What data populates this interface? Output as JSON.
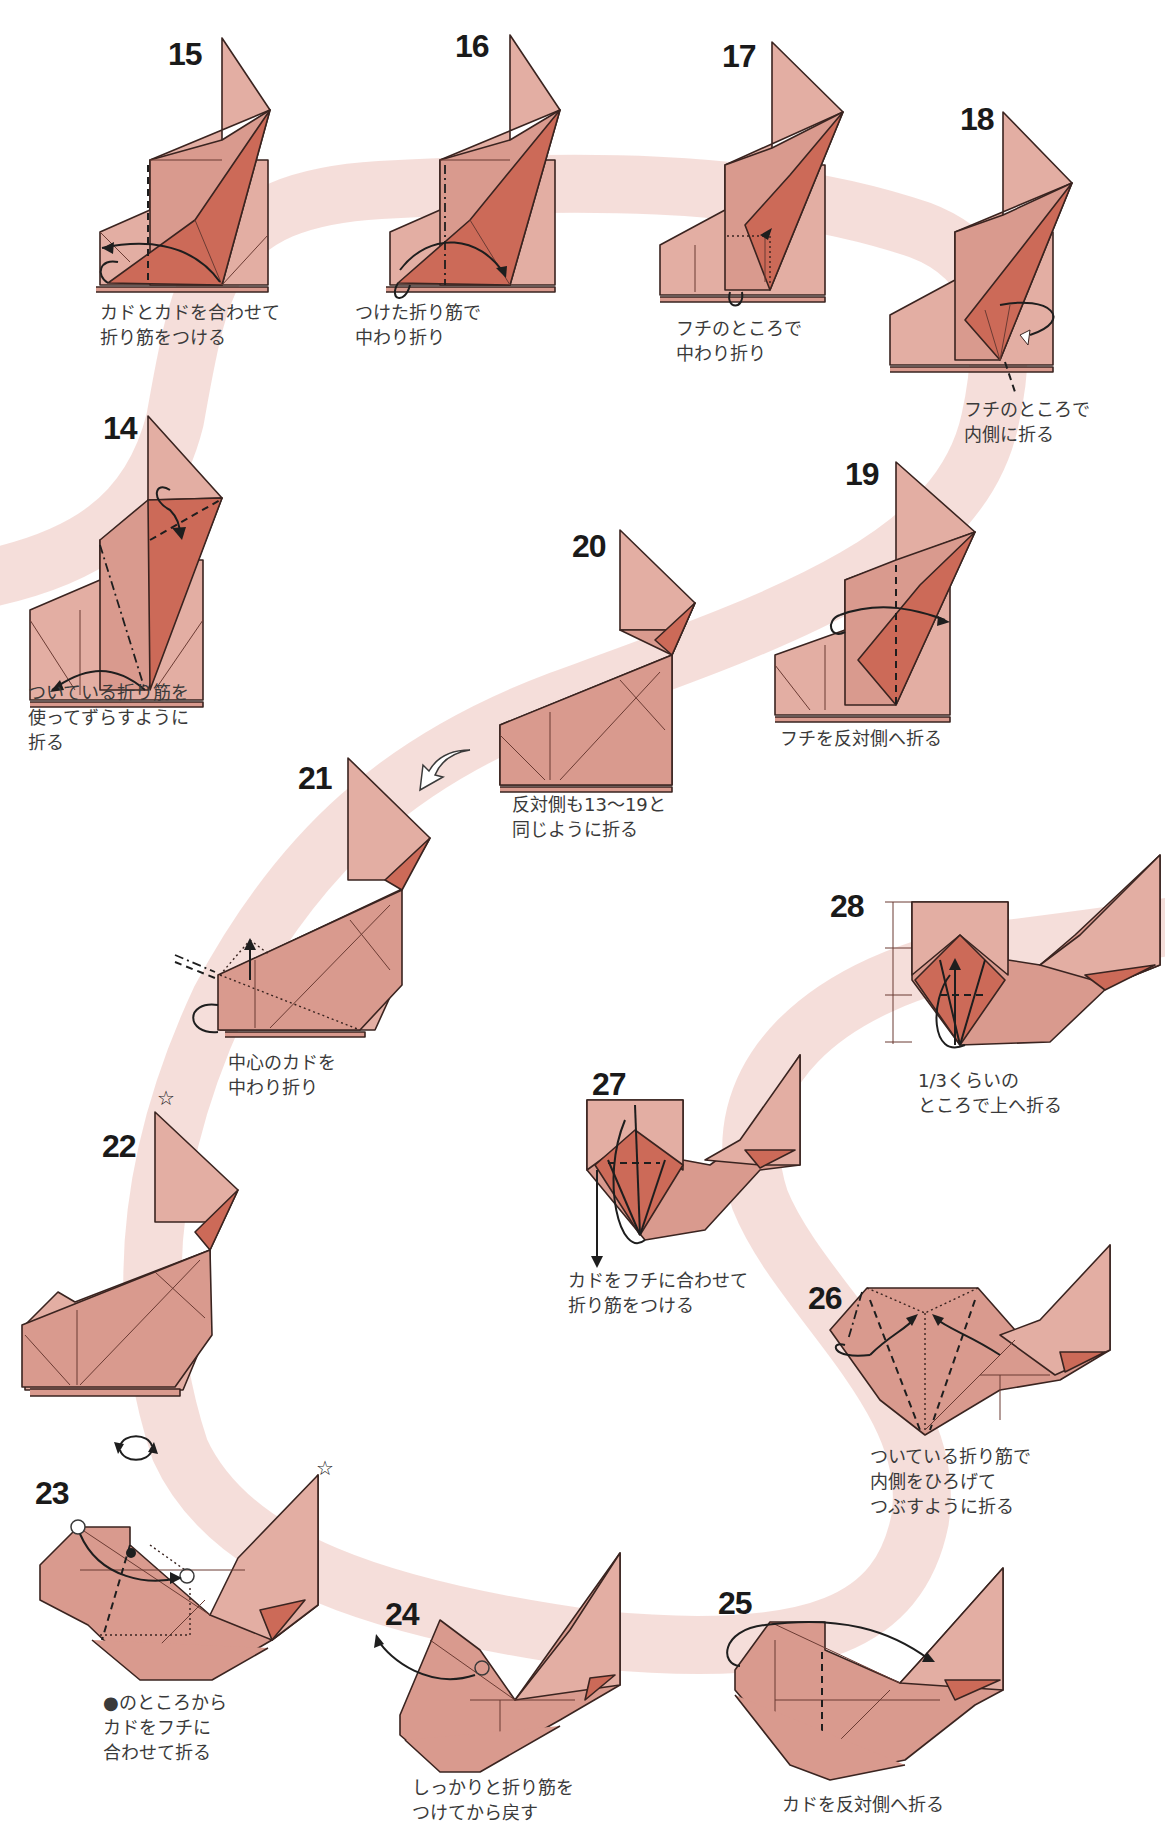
{
  "page": {
    "colors": {
      "paper": "#d99a8e",
      "paper_light": "#e3aea3",
      "paper_dark": "#cc6a58",
      "line": "#3a2420",
      "guide_band": "#f4dcd8",
      "number_text": "#1a1a1a",
      "caption_text": "#3a3a3a"
    }
  },
  "steps": [
    {
      "number": "14",
      "caption": "ついている折り筋を\n使ってずらすように\n折る"
    },
    {
      "number": "15",
      "caption": "カドとカドを合わせて\n折り筋をつける"
    },
    {
      "number": "16",
      "caption": "つけた折り筋で\n中わり折り"
    },
    {
      "number": "17",
      "caption": "フチのところで\n中わり折り"
    },
    {
      "number": "18",
      "caption": "フチのところで\n内側に折る"
    },
    {
      "number": "19",
      "caption": "フチを反対側へ折る"
    },
    {
      "number": "20",
      "caption": "反対側も13〜19と\n同じように折る"
    },
    {
      "number": "21",
      "caption": "中心のカドを\n中わり折り"
    },
    {
      "number": "22",
      "caption": ""
    },
    {
      "number": "23",
      "caption": "●のところから\nカドをフチに\n合わせて折る"
    },
    {
      "number": "24",
      "caption": "しっかりと折り筋を\nつけてから戻す"
    },
    {
      "number": "25",
      "caption": "カドを反対側へ折る"
    },
    {
      "number": "26",
      "caption": "ついている折り筋で\n内側をひろげて\nつぶすように折る"
    },
    {
      "number": "27",
      "caption": "カドをフチに合わせて\n折り筋をつける"
    },
    {
      "number": "28",
      "caption": "1/3くらいの\nところで上へ折る"
    }
  ],
  "symbols": {
    "star_mark": "☆",
    "turn_over": "turn-over-symbol",
    "flip_arrow": "hollow-turn-arrow"
  }
}
